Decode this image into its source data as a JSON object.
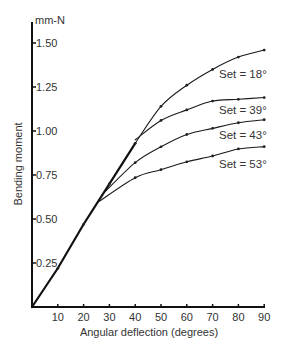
{
  "chart_data": {
    "type": "line",
    "title": "",
    "xlabel": "Angular deflection (degrees)",
    "ylabel": "Bending moment",
    "y_unit": "mm-N",
    "xlim": [
      0,
      90
    ],
    "ylim": [
      0,
      1.5
    ],
    "x_ticks": [
      "10",
      "20",
      "30",
      "40",
      "50",
      "60",
      "70",
      "80",
      "90"
    ],
    "y_ticks": [
      "0.25",
      "0.50",
      "0.75",
      "1.00",
      "1.25",
      "1.50"
    ],
    "grid": false,
    "legend_position": "inline labels at right",
    "series": [
      {
        "name": "Initial loading (common)",
        "x": [
          0,
          10,
          20,
          30,
          40
        ],
        "values": [
          0,
          0.22,
          0.47,
          0.7,
          0.93
        ]
      },
      {
        "name": "Set = 18°",
        "x": [
          40,
          50,
          60,
          70,
          80,
          90
        ],
        "values": [
          0.93,
          1.14,
          1.26,
          1.35,
          1.42,
          1.46
        ]
      },
      {
        "name": "Set = 39°",
        "x": [
          40,
          50,
          60,
          70,
          80,
          90
        ],
        "values": [
          0.95,
          1.06,
          1.12,
          1.17,
          1.18,
          1.19
        ]
      },
      {
        "name": "Set = 43°",
        "x": [
          28,
          40,
          50,
          60,
          70,
          80,
          90
        ],
        "values": [
          0.65,
          0.82,
          0.91,
          0.98,
          1.015,
          1.047,
          1.064
        ]
      },
      {
        "name": "Set = 53°",
        "x": [
          26,
          40,
          50,
          60,
          70,
          80,
          90
        ],
        "values": [
          0.6,
          0.735,
          0.78,
          0.825,
          0.858,
          0.898,
          0.911
        ]
      }
    ]
  },
  "labels": {
    "y_unit": "mm-N",
    "y_title": "Bending moment",
    "x_title": "Angular deflection (degrees)",
    "y_ticks": [
      "0.25",
      "0.50",
      "0.75",
      "1.00",
      "1.25",
      "1.50"
    ],
    "x_ticks": [
      "10",
      "20",
      "30",
      "40",
      "50",
      "60",
      "70",
      "80",
      "90"
    ],
    "series_labels": [
      "Set = 18°",
      "Set = 39°",
      "Set = 43°",
      "Set = 53°"
    ]
  }
}
